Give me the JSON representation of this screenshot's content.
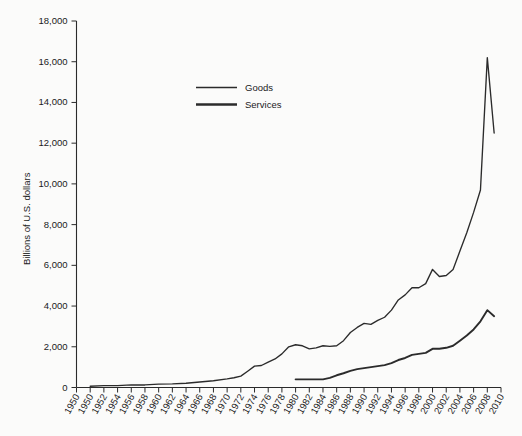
{
  "chart_data": {
    "type": "line",
    "title": "",
    "xlabel": "",
    "ylabel": "Billions of U.S. dollars",
    "ylim": [
      0,
      18000
    ],
    "ytick_values": [
      0,
      2000,
      4000,
      6000,
      8000,
      10000,
      12000,
      14000,
      16000,
      18000
    ],
    "ytick_labels": [
      "0",
      "2,000",
      "4,000",
      "6,000",
      "8,000",
      "10,000",
      "12,000",
      "14,000",
      "16,000",
      "18,000"
    ],
    "xlim": [
      1948,
      2010
    ],
    "xtick_labels": [
      "1950",
      "1950",
      "1952",
      "1954",
      "1956",
      "1958",
      "1960",
      "1962",
      "1964",
      "1966",
      "1968",
      "1970",
      "1972",
      "1974",
      "1976",
      "1978",
      "1980",
      "1982",
      "1984",
      "1986",
      "1988",
      "1990",
      "1992",
      "1994",
      "1996",
      "1998",
      "2000",
      "2002",
      "2004",
      "2006",
      "2008",
      "2010"
    ],
    "grid": false,
    "legend_position": "top-center",
    "legend_entries": [
      "Goods",
      "Services"
    ],
    "series": [
      {
        "name": "Goods",
        "x": [
          1950,
          1952,
          1954,
          1956,
          1958,
          1960,
          1962,
          1964,
          1966,
          1968,
          1970,
          1972,
          1974,
          1976,
          1978,
          1980,
          1982,
          1984,
          1986,
          1988,
          1990,
          1992,
          1994,
          1996,
          1998,
          2000,
          2002,
          2004,
          2006,
          2008,
          2009,
          2010
        ],
        "values": [
          40,
          60,
          60,
          90,
          85,
          110,
          115,
          140,
          180,
          220,
          300,
          380,
          650,
          800,
          970,
          1300,
          1100,
          1150,
          1160,
          1500,
          1800,
          1900,
          2200,
          2600,
          2700,
          3300,
          3050,
          3800,
          4800,
          6000,
          4700,
          5100
        ]
      },
      {
        "name": "Services",
        "x": [
          1980,
          1982,
          1984,
          1986,
          1988,
          1990,
          1992,
          1994,
          1996,
          1998,
          2000,
          2002,
          2004,
          2006,
          2008,
          2009
        ],
        "values": [
          200,
          190,
          190,
          280,
          400,
          520,
          620,
          750,
          900,
          1000,
          1200,
          1250,
          1500,
          2000,
          2600,
          2400
        ]
      }
    ],
    "note": "Combined cumulative curves as plotted: upper curve peaks near 16,200 in 2008 and falls to about 12,500 in 2010; lower curve peaks near 3,800 in 2008 and falls to about 3,500 in 2010."
  },
  "plot": {
    "upper_curve_name": "Goods",
    "lower_curve_name": "Services",
    "upper_points": [
      [
        1950,
        60
      ],
      [
        1952,
        90
      ],
      [
        1954,
        90
      ],
      [
        1956,
        130
      ],
      [
        1958,
        125
      ],
      [
        1960,
        165
      ],
      [
        1962,
        175
      ],
      [
        1964,
        210
      ],
      [
        1966,
        270
      ],
      [
        1968,
        330
      ],
      [
        1970,
        420
      ],
      [
        1971,
        480
      ],
      [
        1972,
        560
      ],
      [
        1973,
        800
      ],
      [
        1974,
        1050
      ],
      [
        1975,
        1080
      ],
      [
        1976,
        1250
      ],
      [
        1977,
        1400
      ],
      [
        1978,
        1650
      ],
      [
        1979,
        2000
      ],
      [
        1980,
        2100
      ],
      [
        1981,
        2050
      ],
      [
        1982,
        1900
      ],
      [
        1983,
        1950
      ],
      [
        1984,
        2050
      ],
      [
        1985,
        2020
      ],
      [
        1986,
        2050
      ],
      [
        1987,
        2300
      ],
      [
        1988,
        2700
      ],
      [
        1989,
        2950
      ],
      [
        1990,
        3150
      ],
      [
        1991,
        3100
      ],
      [
        1992,
        3300
      ],
      [
        1993,
        3450
      ],
      [
        1994,
        3800
      ],
      [
        1995,
        4300
      ],
      [
        1996,
        4550
      ],
      [
        1997,
        4900
      ],
      [
        1998,
        4900
      ],
      [
        1999,
        5100
      ],
      [
        2000,
        5800
      ],
      [
        2001,
        5450
      ],
      [
        2002,
        5500
      ],
      [
        2003,
        5800
      ],
      [
        2004,
        6700
      ],
      [
        2005,
        7600
      ],
      [
        2006,
        8600
      ],
      [
        2007,
        9700
      ],
      [
        2008,
        16200
      ],
      [
        2009,
        12500
      ]
    ],
    "lower_points": [
      [
        1980,
        400
      ],
      [
        1981,
        400
      ],
      [
        1982,
        400
      ],
      [
        1983,
        400
      ],
      [
        1984,
        400
      ],
      [
        1985,
        470
      ],
      [
        1986,
        600
      ],
      [
        1987,
        700
      ],
      [
        1988,
        820
      ],
      [
        1989,
        900
      ],
      [
        1990,
        950
      ],
      [
        1991,
        1000
      ],
      [
        1992,
        1050
      ],
      [
        1993,
        1100
      ],
      [
        1994,
        1200
      ],
      [
        1995,
        1350
      ],
      [
        1996,
        1450
      ],
      [
        1997,
        1600
      ],
      [
        1998,
        1650
      ],
      [
        1999,
        1700
      ],
      [
        2000,
        1900
      ],
      [
        2001,
        1900
      ],
      [
        2002,
        1950
      ],
      [
        2003,
        2050
      ],
      [
        2004,
        2300
      ],
      [
        2005,
        2550
      ],
      [
        2006,
        2850
      ],
      [
        2007,
        3250
      ],
      [
        2008,
        3800
      ],
      [
        2009,
        3500
      ]
    ]
  }
}
